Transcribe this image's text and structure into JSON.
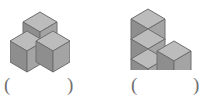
{
  "page": {
    "background_color": "#ffffff",
    "type": "cube-counting-worksheet"
  },
  "palette": {
    "cube_top": "#b9b9b9",
    "cube_left": "#8f8f8f",
    "cube_right": "#a3a3a3",
    "cube_edge": "#6e6e6e",
    "paren_color": "#6f6f6f"
  },
  "figures": [
    {
      "id": "figure-1",
      "label": "left-cube-figure",
      "cube_count": 3,
      "arrangement": "one cube at back raised above, two cubes in front at left and right",
      "cubes": [
        {
          "name": "back-top-cube",
          "grid": [
            1,
            1,
            1
          ]
        },
        {
          "name": "front-left-cube",
          "grid": [
            0,
            0,
            0
          ]
        },
        {
          "name": "front-right-cube",
          "grid": [
            2,
            0,
            0
          ]
        }
      ]
    },
    {
      "id": "figure-2",
      "label": "right-cube-figure",
      "cube_count": 4,
      "arrangement": "vertical stack of three cubes with one cube attached at front right of the bottom level",
      "cubes": [
        {
          "name": "stack-top-cube",
          "grid": [
            0,
            0,
            2
          ]
        },
        {
          "name": "stack-middle-cube",
          "grid": [
            0,
            0,
            1
          ]
        },
        {
          "name": "stack-bottom-cube",
          "grid": [
            0,
            0,
            0
          ]
        },
        {
          "name": "side-cube",
          "grid": [
            1,
            0,
            0
          ]
        }
      ]
    }
  ],
  "answers": [
    {
      "id": "answer-1",
      "for_figure": "figure-1",
      "open_paren": "(",
      "close_paren": ")",
      "value": ""
    },
    {
      "id": "answer-2",
      "for_figure": "figure-2",
      "open_paren": "(",
      "close_paren": ")",
      "value": ""
    }
  ]
}
